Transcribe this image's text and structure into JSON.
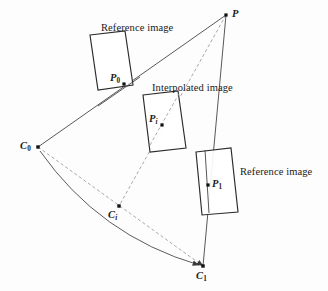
{
  "figure": {
    "background_color": "#fdfdfd",
    "line_color": "#3a3a3a",
    "dash_color": "#8a8a8a",
    "text_color": "#1a1a1a",
    "width": 328,
    "height": 291
  },
  "captions": {
    "reference_image_top": "Reference image",
    "interpolated_image": "Interpolated image",
    "reference_image_right": "Reference image"
  },
  "points": {
    "scene_point": {
      "label": "P",
      "subscript": "",
      "x": 226,
      "y": 15
    },
    "projection_p0": {
      "label": "P",
      "subscript": "0",
      "x": 124,
      "y": 84
    },
    "projection_pi": {
      "label": "P",
      "subscript": "i",
      "x": 162,
      "y": 125
    },
    "projection_p1": {
      "label": "P",
      "subscript": "1",
      "x": 208,
      "y": 185
    },
    "camera_c0": {
      "label": "C",
      "subscript": "0",
      "x": 38,
      "y": 147
    },
    "camera_ci": {
      "label": "C",
      "subscript": "i",
      "x": 119,
      "y": 206
    },
    "camera_c1": {
      "label": "C",
      "subscript": "1",
      "x": 203,
      "y": 266
    }
  },
  "planes": [
    {
      "name": "reference-plane-0",
      "corners": "90,35 125,31 133,85 98,90"
    },
    {
      "name": "interpolated-plane",
      "corners": "143,95 178,91 186,148 150,152"
    },
    {
      "name": "reference-plane-1",
      "corners": "196,152 231,148 238,212 202,215"
    }
  ],
  "rays": [
    {
      "name": "ray-p-to-c0",
      "style": "solid",
      "from": "P",
      "to": "C0"
    },
    {
      "name": "ray-p-to-ci",
      "style": "dashed",
      "from": "P",
      "to": "Ci"
    },
    {
      "name": "ray-p-to-c1",
      "style": "solid",
      "from": "P",
      "to": "C1"
    },
    {
      "name": "baseline-c0-to-c1",
      "style": "dashed",
      "from": "C0",
      "to": "C1"
    },
    {
      "name": "camera-path-arc",
      "style": "solid-curve",
      "from": "C0",
      "to": "C1"
    }
  ]
}
